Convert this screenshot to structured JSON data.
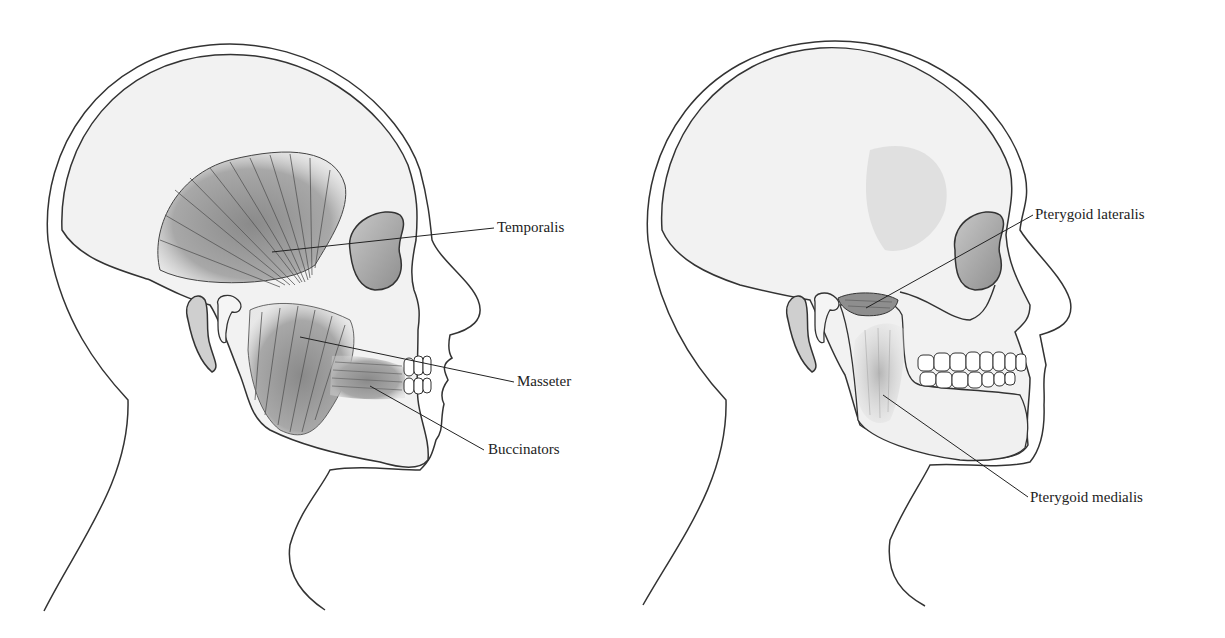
{
  "figure": {
    "panels": [
      {
        "id": "left",
        "description": "Lateral head view showing superficial muscles of mastication",
        "labels": [
          {
            "text": "Temporalis",
            "x": 497,
            "y": 221
          },
          {
            "text": "Masseter",
            "x": 517,
            "y": 375
          },
          {
            "text": "Buccinators",
            "x": 488,
            "y": 443
          }
        ]
      },
      {
        "id": "right",
        "description": "Lateral head view with skull showing deep muscles of mastication",
        "labels": [
          {
            "text": "Pterygoid lateralis",
            "x": 1035,
            "y": 209
          },
          {
            "text": "Pterygoid medialis",
            "x": 1030,
            "y": 491
          }
        ]
      }
    ],
    "colors": {
      "outline": "#333333",
      "skin_fill": "#f2f2f2",
      "muscle_fill": "#9a9a9a",
      "fiber": "#555555",
      "label_text": "#222222",
      "background": "#ffffff"
    }
  }
}
